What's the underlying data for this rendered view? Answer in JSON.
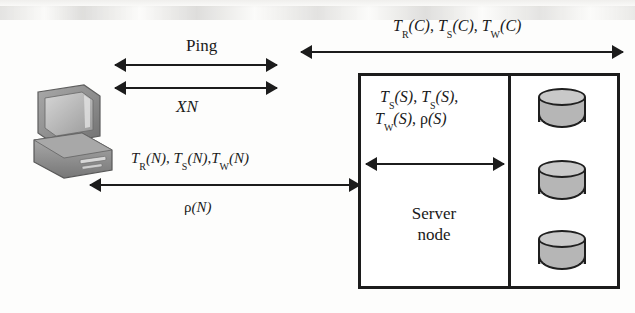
{
  "diagram": {
    "labels": {
      "ping": "Ping",
      "xn": "XN",
      "network_metrics_line1": "T_R(N), T_S(N),T_W(N)",
      "network_metrics_line2": "ρ(N)",
      "client_metrics": "T_R(C), T_S(C), T_W(C)",
      "server_metrics_line1": "T_S(S), T_S(S),",
      "server_metrics_line2": "T_W(S), ρ(S)",
      "server_node_line1": "Server",
      "server_node_line2": "node"
    },
    "metric_tokens": {
      "client": [
        {
          "sym": "T",
          "sub": "R",
          "arg": "(C)",
          "sep": ", "
        },
        {
          "sym": "T",
          "sub": "S",
          "arg": "(C)",
          "sep": ", "
        },
        {
          "sym": "T",
          "sub": "W",
          "arg": "(C)",
          "sep": ""
        }
      ],
      "network": [
        {
          "sym": "T",
          "sub": "R",
          "arg": "(N)",
          "sep": ", "
        },
        {
          "sym": "T",
          "sub": "S",
          "arg": "(N)",
          "sep": ","
        },
        {
          "sym": "T",
          "sub": "W",
          "arg": "(N)",
          "sep": ""
        }
      ],
      "network_rho": "ρ(N)",
      "server_row1": [
        {
          "sym": "T",
          "sub": "S",
          "arg": "(S)",
          "sep": ", "
        },
        {
          "sym": "T",
          "sub": "S",
          "arg": "(S)",
          "sep": ","
        }
      ],
      "server_row2": [
        {
          "sym": "T",
          "sub": "W",
          "arg": "(S)",
          "sep": ", "
        }
      ],
      "server_rho": "ρ(S)"
    },
    "nodes": [
      {
        "name": "client-workstation",
        "kind": "computer-icon"
      },
      {
        "name": "server-node",
        "kind": "box"
      },
      {
        "name": "disk-1",
        "kind": "disk"
      },
      {
        "name": "disk-2",
        "kind": "disk"
      },
      {
        "name": "disk-3",
        "kind": "disk"
      }
    ],
    "arrows": [
      {
        "name": "ping-arrow",
        "direction": "both"
      },
      {
        "name": "xn-arrow",
        "direction": "both"
      },
      {
        "name": "network-arrow",
        "direction": "both"
      },
      {
        "name": "client-metrics-arrow",
        "direction": "both"
      },
      {
        "name": "server-internal-arrow",
        "direction": "both"
      }
    ],
    "colors": {
      "ink": "#1c1c1c",
      "disk_fill": "#b6b6b6",
      "disk_top": "#c9c9c9",
      "page": "#fdfdfc"
    }
  }
}
